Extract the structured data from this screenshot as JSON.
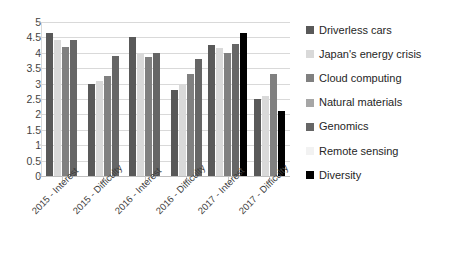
{
  "chart_data": {
    "type": "bar",
    "title": "",
    "xlabel": "",
    "ylabel": "",
    "ylim": [
      0,
      5
    ],
    "yticks": [
      "0",
      "0.5",
      "1",
      "1.5",
      "2",
      "2.5",
      "3",
      "3.5",
      "4",
      "4.5",
      "5"
    ],
    "grid": true,
    "legend_position": "right",
    "categories": [
      "2015 - Interest",
      "2015 - Difficulty",
      "2016 - Interest",
      "2016 - Difficulty",
      "2017 - Interest",
      "2017 - Difficulty"
    ],
    "series": [
      {
        "name": "Driverless cars",
        "color": "#595959",
        "values": [
          4.65,
          3.0,
          4.5,
          2.8,
          4.25,
          2.5
        ]
      },
      {
        "name": "Japan's energy crisis",
        "color": "#d9d9d9",
        "values": [
          4.4,
          3.1,
          3.95,
          3.0,
          4.15,
          2.6
        ]
      },
      {
        "name": "Cloud computing",
        "color": "#808080",
        "values": [
          4.2,
          3.25,
          3.85,
          3.3,
          4.0,
          3.3
        ]
      },
      {
        "name": "Natural materials",
        "color": "#a6a6a6",
        "values": [
          null,
          null,
          null,
          null,
          null,
          null
        ]
      },
      {
        "name": "Genomics",
        "color": "#666666",
        "values": [
          4.4,
          3.9,
          4.0,
          3.8,
          4.3,
          null
        ]
      },
      {
        "name": "Remote sensing",
        "color": "#f2f2f2",
        "values": [
          null,
          null,
          null,
          null,
          null,
          null
        ]
      },
      {
        "name": "Diversity",
        "color": "#000000",
        "values": [
          null,
          null,
          null,
          null,
          4.65,
          2.1
        ]
      }
    ]
  },
  "legend": {
    "items": [
      "Driverless cars",
      "Japan's energy crisis",
      "Cloud computing",
      "Natural materials",
      "Genomics",
      "Remote sensing",
      "Diversity"
    ]
  }
}
